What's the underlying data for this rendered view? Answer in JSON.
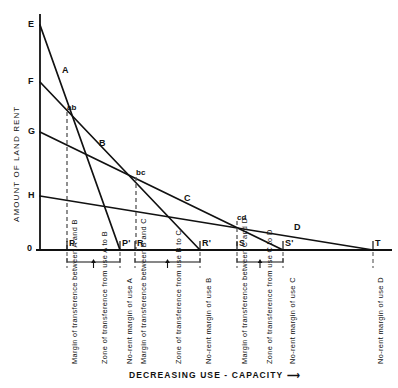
{
  "chart_data": {
    "type": "line",
    "title": "",
    "xlabel": "DECREASING USE - CAPACITY —→",
    "ylabel": "AMOUNT OF LAND RENT",
    "grid": false,
    "legend": "inline-curve-labels",
    "axis_origin_label": "0",
    "xlim": [
      0,
      398
    ],
    "ylim": [
      0,
      250
    ],
    "y_intercepts": [
      {
        "name": "E",
        "x": 40,
        "y": 25,
        "belongs_to": "A"
      },
      {
        "name": "F",
        "x": 40,
        "y": 82,
        "belongs_to": "B"
      },
      {
        "name": "G",
        "x": 40,
        "y": 132,
        "belongs_to": "C"
      },
      {
        "name": "H",
        "x": 40,
        "y": 196,
        "belongs_to": "D"
      }
    ],
    "series": [
      {
        "name": "A",
        "from": "E",
        "to": "P'",
        "x0": 40,
        "y0": 25,
        "x1": 120,
        "y1": 250
      },
      {
        "name": "B",
        "from": "F",
        "to": "R'",
        "x0": 40,
        "y0": 82,
        "x1": 200,
        "y1": 250
      },
      {
        "name": "C",
        "from": "G",
        "to": "S'",
        "x0": 40,
        "y0": 132,
        "x1": 283,
        "y1": 250
      },
      {
        "name": "D",
        "from": "H",
        "to": "T",
        "x0": 40,
        "y0": 196,
        "x1": 373,
        "y1": 250
      }
    ],
    "curve_labels": [
      {
        "text": "A",
        "x": 62,
        "y": 66
      },
      {
        "text": "B",
        "x": 99,
        "y": 139
      },
      {
        "text": "C",
        "x": 184,
        "y": 194
      },
      {
        "text": "D",
        "x": 294,
        "y": 223
      }
    ],
    "intersections": [
      {
        "text": "ab",
        "x": 67,
        "y": 104,
        "px": 72,
        "py": 112,
        "between": [
          "A",
          "B"
        ]
      },
      {
        "text": "bc",
        "x": 136,
        "y": 169,
        "px": 141,
        "py": 177,
        "between": [
          "B",
          "C"
        ]
      },
      {
        "text": "cd",
        "x": 237,
        "y": 214,
        "px": 242,
        "py": 221,
        "between": [
          "C",
          "D"
        ]
      }
    ],
    "x_axis_points": [
      {
        "name": "P",
        "x": 67
      },
      {
        "name": "P'",
        "x": 120
      },
      {
        "name": "R",
        "x": 135
      },
      {
        "name": "R'",
        "x": 200
      },
      {
        "name": "S",
        "x": 237
      },
      {
        "name": "S'",
        "x": 283
      },
      {
        "name": "T",
        "x": 373
      }
    ],
    "drop_lines": [
      {
        "from": "ab",
        "to": "P",
        "x": 67,
        "y_top": 112,
        "y_bottom": 250
      },
      {
        "from": "bc",
        "to": "R",
        "x": 136,
        "y_top": 177,
        "y_bottom": 250
      },
      {
        "from": "cd",
        "to": "S",
        "x": 237,
        "y_top": 221,
        "y_bottom": 250
      }
    ],
    "annotations": [
      {
        "id": "ann-margin-ab",
        "text": "Margin of transference between A and B",
        "x": 67,
        "kind": "margin"
      },
      {
        "id": "ann-zone-ab",
        "text": "Zone of transference from use A to B",
        "x": 95,
        "kind": "zone"
      },
      {
        "id": "ann-norent-a",
        "text": "No-rent margin of use A",
        "x": 120,
        "kind": "no-rent"
      },
      {
        "id": "ann-margin-bc",
        "text": "Margin of transference between B and C",
        "x": 135,
        "kind": "margin"
      },
      {
        "id": "ann-zone-bc",
        "text": "Zone of transference from use B to C",
        "x": 169,
        "kind": "zone"
      },
      {
        "id": "ann-norent-b",
        "text": "No-rent margin of use B",
        "x": 200,
        "kind": "no-rent"
      },
      {
        "id": "ann-margin-cd",
        "text": "Margin of transference between C and D",
        "x": 237,
        "kind": "margin"
      },
      {
        "id": "ann-zone-cd",
        "text": "Zone of transference from use C to D",
        "x": 260,
        "kind": "zone"
      },
      {
        "id": "ann-norent-c",
        "text": "No-rent margin of use C",
        "x": 283,
        "kind": "no-rent"
      },
      {
        "id": "ann-norent-d",
        "text": "No-rent margin of use D",
        "x": 373,
        "kind": "no-rent"
      }
    ],
    "brackets": [
      {
        "id": "bracket-ab",
        "x_start": 67,
        "x_end": 120,
        "label": "Zone of transference from use A to B"
      },
      {
        "id": "bracket-bc",
        "x_start": 135,
        "x_end": 200,
        "label": "Zone of transference from use B to C"
      },
      {
        "id": "bracket-cd",
        "x_start": 237,
        "x_end": 283,
        "label": "Zone of transference from use C to D"
      }
    ]
  },
  "labels": {
    "y_axis_title": "AMOUNT OF LAND RENT",
    "x_axis_title": "DECREASING USE - CAPACITY",
    "x_axis_arrow": "⟶",
    "origin": "0",
    "E": "E",
    "F": "F",
    "G": "G",
    "H": "H",
    "P": "P",
    "Pp": "P'",
    "R": "R",
    "Rp": "R'",
    "S": "S",
    "Sp": "S'",
    "T": "T",
    "A": "A",
    "B": "B",
    "C": "C",
    "D": "D",
    "ab": "ab",
    "bc": "bc",
    "cd": "cd",
    "ann": {
      "margin_ab": "Margin of transference between A and B",
      "zone_ab": "Zone of transference from use A to B",
      "norent_a": "No-rent margin of use A",
      "margin_bc": "Margin of transference between B and C",
      "zone_bc": "Zone of transference from use B to C",
      "norent_b": "No-rent margin of use B",
      "margin_cd": "Margin of transference between C and D",
      "zone_cd": "Zone of transference from use C to D",
      "norent_c": "No-rent margin of use C",
      "norent_d": "No-rent margin of use D"
    }
  },
  "colors": {
    "ink": "#111111",
    "background": "#ffffff",
    "dash": "#555555"
  }
}
